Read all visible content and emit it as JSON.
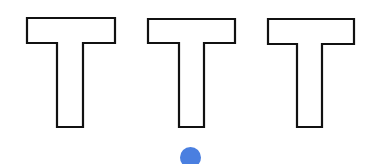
{
  "scene": {
    "background": "#ffffff",
    "letters": [
      {
        "glyph": "T",
        "x": 27,
        "stroke": "#111111",
        "fill": "#ffffff"
      },
      {
        "glyph": "T",
        "x": 147,
        "stroke": "#111111",
        "fill": "#ffffff"
      },
      {
        "glyph": "T",
        "x": 267,
        "stroke": "#111111",
        "fill": "#ffffff"
      }
    ],
    "dot": {
      "cx": 190,
      "cy": 157,
      "r": 10,
      "color": "#4a7fe0"
    }
  }
}
